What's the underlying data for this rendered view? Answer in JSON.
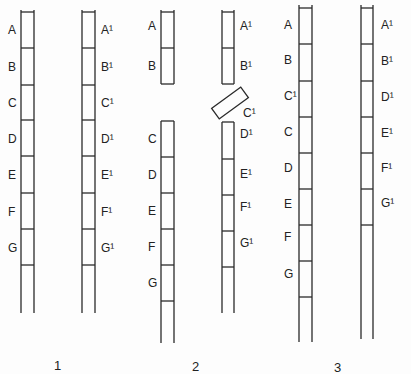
{
  "diagram": {
    "type": "chromosome-pair-crossover-illustration",
    "groups": [
      {
        "label": "1",
        "description": "Homologous pair, intact",
        "chromosomes": [
          {
            "side": "left",
            "segments": [
              "A",
              "B",
              "C",
              "D",
              "E",
              "F",
              "G"
            ]
          },
          {
            "side": "right",
            "segments": [
              "A¹",
              "B¹",
              "C¹",
              "D¹",
              "E¹",
              "F¹",
              "G¹"
            ]
          }
        ]
      },
      {
        "label": "2",
        "description": "Breakage: left chromosome broken between B and C; right chromosome loses C¹ fragment",
        "chromosomes": [
          {
            "side": "left",
            "fragments": [
              [
                "A",
                "B"
              ],
              [
                "C",
                "D",
                "E",
                "F",
                "G"
              ]
            ]
          },
          {
            "side": "right",
            "fragments": [
              [
                "A¹",
                "B¹"
              ],
              [
                "C¹"
              ],
              [
                "D¹",
                "E¹",
                "F¹",
                "G¹"
              ]
            ]
          }
        ]
      },
      {
        "label": "3",
        "description": "Result: C¹ inserted into left chromosome (duplication); right chromosome deficient for C¹",
        "chromosomes": [
          {
            "side": "left",
            "segments": [
              "A",
              "B",
              "C¹",
              "C",
              "D",
              "E",
              "F",
              "G"
            ]
          },
          {
            "side": "right",
            "segments": [
              "A¹",
              "B¹",
              "D¹",
              "E¹",
              "F¹",
              "G¹"
            ]
          }
        ]
      }
    ]
  },
  "labels": {
    "g1_left": [
      "A",
      "B",
      "C",
      "D",
      "E",
      "F",
      "G"
    ],
    "g1_right": [
      "A¹",
      "B¹",
      "C¹",
      "D¹",
      "E¹",
      "F¹",
      "G¹"
    ],
    "g2_left_top": [
      "A",
      "B"
    ],
    "g2_left_bottom": [
      "C",
      "D",
      "E",
      "F",
      "G"
    ],
    "g2_right_top": [
      "A¹",
      "B¹"
    ],
    "g2_fragment": "C¹",
    "g2_right_bottom": [
      "D¹",
      "E¹",
      "F¹",
      "G¹"
    ],
    "g3_left": [
      "A",
      "B",
      "C¹",
      "C",
      "D",
      "E",
      "F",
      "G"
    ],
    "g3_right": [
      "A¹",
      "B¹",
      "D¹",
      "E¹",
      "F¹",
      "G¹"
    ],
    "group_numbers": [
      "1",
      "2",
      "3"
    ]
  }
}
